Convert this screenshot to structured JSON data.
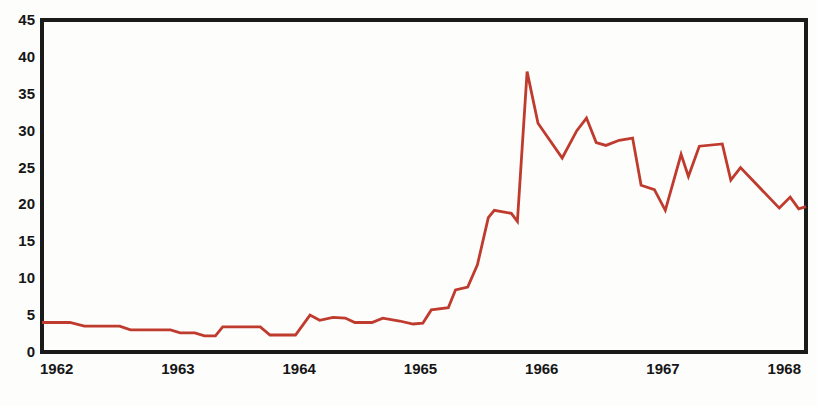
{
  "chart_data": {
    "type": "line",
    "title": "",
    "xlabel": "",
    "ylabel": "",
    "grid": false,
    "legend": "none",
    "frame_color": "#1b1b1b",
    "background_color": "#fdfdfc",
    "x_axis": {
      "range": [
        1962,
        1968.3
      ],
      "tick_years": [
        1962,
        1963,
        1964,
        1965,
        1966,
        1967,
        1968
      ],
      "tick_labels": [
        "1962",
        "1963",
        "1964",
        "1965",
        "1966",
        "1967",
        "1968"
      ]
    },
    "y_axis": {
      "range": [
        0,
        45
      ],
      "ticks": [
        0,
        5,
        10,
        15,
        20,
        25,
        30,
        35,
        40,
        45
      ],
      "tick_labels": [
        "0",
        "5",
        "10",
        "15",
        "20",
        "25",
        "30",
        "35",
        "40",
        "45"
      ]
    },
    "series": [
      {
        "name": "monthly-value",
        "color": "#bf3b2d",
        "points": [
          [
            1962.0,
            4.0
          ],
          [
            1962.23,
            4.0
          ],
          [
            1962.35,
            3.5
          ],
          [
            1962.64,
            3.5
          ],
          [
            1962.73,
            3.0
          ],
          [
            1963.06,
            3.0
          ],
          [
            1963.14,
            2.6
          ],
          [
            1963.26,
            2.6
          ],
          [
            1963.34,
            2.2
          ],
          [
            1963.43,
            2.2
          ],
          [
            1963.49,
            3.4
          ],
          [
            1963.8,
            3.4
          ],
          [
            1963.88,
            2.3
          ],
          [
            1964.09,
            2.3
          ],
          [
            1964.21,
            5.0
          ],
          [
            1964.29,
            4.3
          ],
          [
            1964.4,
            4.7
          ],
          [
            1964.5,
            4.6
          ],
          [
            1964.58,
            4.0
          ],
          [
            1964.72,
            4.0
          ],
          [
            1964.81,
            4.6
          ],
          [
            1964.95,
            4.2
          ],
          [
            1965.06,
            3.8
          ],
          [
            1965.14,
            3.9
          ],
          [
            1965.21,
            5.7
          ],
          [
            1965.35,
            6.0
          ],
          [
            1965.41,
            8.4
          ],
          [
            1965.51,
            8.8
          ],
          [
            1965.59,
            11.8
          ],
          [
            1965.68,
            18.2
          ],
          [
            1965.73,
            19.2
          ],
          [
            1965.87,
            18.8
          ],
          [
            1965.92,
            17.7
          ],
          [
            1966.0,
            38.0
          ],
          [
            1966.09,
            31.0
          ],
          [
            1966.29,
            26.3
          ],
          [
            1966.41,
            30.0
          ],
          [
            1966.49,
            31.7
          ],
          [
            1966.57,
            28.4
          ],
          [
            1966.65,
            28.0
          ],
          [
            1966.76,
            28.7
          ],
          [
            1966.87,
            29.0
          ],
          [
            1966.94,
            22.6
          ],
          [
            1967.05,
            22.0
          ],
          [
            1967.14,
            19.2
          ],
          [
            1967.27,
            26.8
          ],
          [
            1967.33,
            23.8
          ],
          [
            1967.42,
            27.9
          ],
          [
            1967.61,
            28.2
          ],
          [
            1967.68,
            23.3
          ],
          [
            1967.76,
            25.0
          ],
          [
            1968.08,
            19.5
          ],
          [
            1968.17,
            21.0
          ],
          [
            1968.24,
            19.4
          ],
          [
            1968.3,
            19.7
          ]
        ]
      }
    ]
  }
}
